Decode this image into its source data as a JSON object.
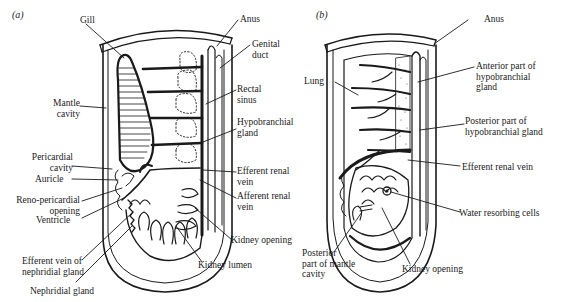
{
  "figure": {
    "panels": [
      {
        "id": "a",
        "tag": "(a)",
        "labels": [
          {
            "key": "gill",
            "text": "Gill"
          },
          {
            "key": "mantle_cavity",
            "text": "Mantle\ncavity"
          },
          {
            "key": "pericardial_cavity",
            "text": "Pericardial\ncavity"
          },
          {
            "key": "auricle",
            "text": "Auricle"
          },
          {
            "key": "reno_pericardial_opening",
            "text": "Reno-pericardial\nopening"
          },
          {
            "key": "ventricle",
            "text": "Ventricle"
          },
          {
            "key": "efferent_vein_nephridial",
            "text": "Efferent vein of\nnephridial gland"
          },
          {
            "key": "nephridial_gland",
            "text": "Nephridial gland"
          },
          {
            "key": "anus",
            "text": "Anus"
          },
          {
            "key": "genital_duct",
            "text": "Genital\nduct"
          },
          {
            "key": "rectal_sinus",
            "text": "Rectal\nsinus"
          },
          {
            "key": "hypobranchial_gland",
            "text": "Hypobranchial\ngland"
          },
          {
            "key": "efferent_renal_vein",
            "text": "Efferent renal\nvein"
          },
          {
            "key": "afferent_renal_vein",
            "text": "Afferent renal\nvein"
          },
          {
            "key": "kidney_opening",
            "text": "Kidney opening"
          },
          {
            "key": "kidney_lumen",
            "text": "Kidney lumen"
          }
        ]
      },
      {
        "id": "b",
        "tag": "(b)",
        "labels": [
          {
            "key": "anus",
            "text": "Anus"
          },
          {
            "key": "lung",
            "text": "Lung"
          },
          {
            "key": "anterior_hypobranchial",
            "text": "Anterior part of\nhypobranchial\ngland"
          },
          {
            "key": "posterior_hypobranchial",
            "text": "Posterior part of\nhypobranchial gland"
          },
          {
            "key": "efferent_renal_vein",
            "text": "Efferent renal vein"
          },
          {
            "key": "water_resorbing_cells",
            "text": "Water resorbing cells"
          },
          {
            "key": "posterior_mantle_cavity",
            "text": "Posterior\npart of mantle\ncavity"
          },
          {
            "key": "kidney_opening",
            "text": "Kidney opening"
          }
        ]
      }
    ],
    "colors": {
      "ink": "#1a1a1a",
      "background": "#ffffff"
    }
  }
}
